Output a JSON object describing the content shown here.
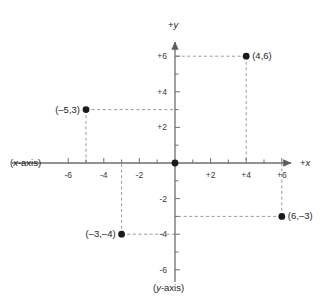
{
  "figure": {
    "axis_labels": {
      "x_axis_name": "(x-axis)",
      "y_axis_name": "(y-axis)",
      "x_positive_prefix": "+",
      "x_positive_var": "x",
      "y_positive_prefix": "+",
      "y_positive_var": "y"
    },
    "colors": {
      "axis": "#6e6e6e",
      "point": "#1a1a1a",
      "dashed": "#9a9a9a",
      "text": "#1e1e1e",
      "background": "#ffffff"
    }
  },
  "chart_data": {
    "type": "scatter",
    "title": "",
    "xlabel": "(x-axis)",
    "ylabel": "(y-axis)",
    "xlim": [
      -7,
      7
    ],
    "ylim": [
      -7,
      7
    ],
    "grid": false,
    "legend": "none",
    "xticks": [
      -6,
      -4,
      -2,
      2,
      4,
      6
    ],
    "yticks": [
      -6,
      -4,
      -2,
      2,
      4,
      6
    ],
    "xtick_labels": [
      "-6",
      "-4",
      "-2",
      "+2",
      "+4",
      "+6"
    ],
    "ytick_labels": [
      "-6",
      "-4",
      "-2",
      "+2",
      "+4",
      "+6"
    ],
    "minor_tick_step": 1,
    "points": [
      {
        "label": "(4,6)",
        "x": 4,
        "y": 6,
        "label_side": "right"
      },
      {
        "label": "(–5,3)",
        "x": -5,
        "y": 3,
        "label_side": "left"
      },
      {
        "label": "(6,–3)",
        "x": 6,
        "y": -3,
        "label_side": "right"
      },
      {
        "label": "(–3,–4)",
        "x": -3,
        "y": -4,
        "label_side": "left"
      },
      {
        "label": "",
        "x": 0,
        "y": 0,
        "label_side": "none"
      }
    ],
    "guide_lines": "dashed leaders from each point to both axes"
  }
}
